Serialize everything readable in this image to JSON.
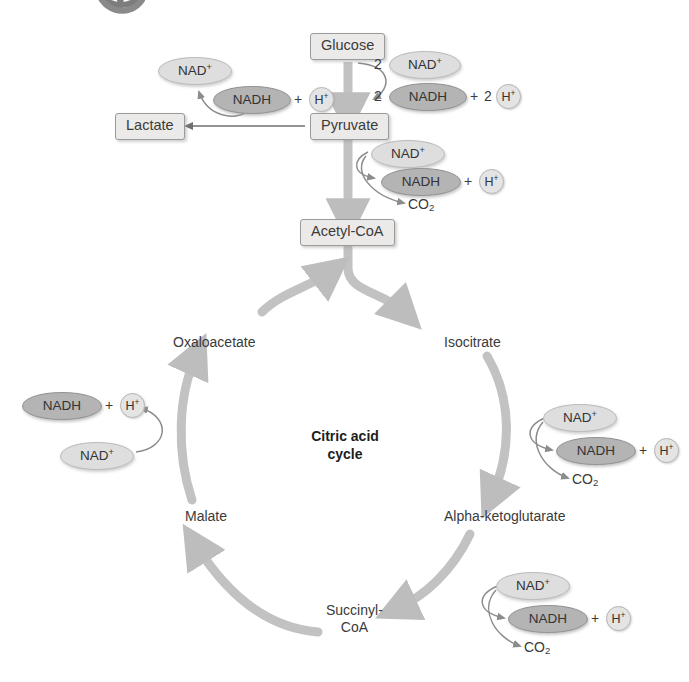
{
  "diagram": {
    "title": "Citric acid cycle",
    "cycle_center_label_line1": "Citric acid",
    "cycle_center_label_line2": "cycle",
    "colors": {
      "nad_plus_fill": "#dedede",
      "nadh_fill": "#b4b4b4",
      "box_fill": "#eceae8",
      "arrow_gray": "#b9b9b9",
      "thin_arrow": "#8c8c8c",
      "text": "#3a3a3a"
    }
  },
  "boxes": {
    "glucose": "Glucose",
    "pyruvate": "Pyruvate",
    "lactate": "Lactate",
    "acetyl_coa": "Acetyl-CoA"
  },
  "cycle_nodes": {
    "oxaloacetate": "Oxaloacetate",
    "isocitrate": "Isocitrate",
    "alpha_ketoglutarate": "Alpha-ketoglutarate",
    "succinyl_coa_line1": "Succinyl-",
    "succinyl_coa_line2": "CoA",
    "malate": "Malate"
  },
  "labels": {
    "nad_plus": "NAD",
    "nad_plus_charge": "+",
    "nadh": "NADH",
    "h_plus": "H",
    "h_plus_charge": "+",
    "co2": "CO",
    "co2_sub": "2",
    "plus": "+",
    "two": "2"
  },
  "glycolysis_step": {
    "nad_plus_count": "2",
    "nad_plus": "NAD",
    "nadh_count": "2",
    "nadh": "NADH",
    "plus": "+",
    "h_count": "2",
    "h_plus": "H"
  },
  "lactate_step": {
    "nadh": "NADH",
    "plus": "+",
    "h_plus": "H",
    "nad_plus": "NAD"
  },
  "pdh_step": {
    "nad_plus": "NAD",
    "nadh": "NADH",
    "plus": "+",
    "h_plus": "H",
    "co2": "CO"
  },
  "isocitrate_step": {
    "nad_plus": "NAD",
    "nadh": "NADH",
    "plus": "+",
    "h_plus": "H",
    "co2": "CO"
  },
  "akg_step": {
    "nad_plus": "NAD",
    "nadh": "NADH",
    "plus": "+",
    "h_plus": "H",
    "co2": "CO"
  },
  "malate_step": {
    "nadh": "NADH",
    "plus": "+",
    "h_plus": "H",
    "nad_plus": "NAD"
  }
}
